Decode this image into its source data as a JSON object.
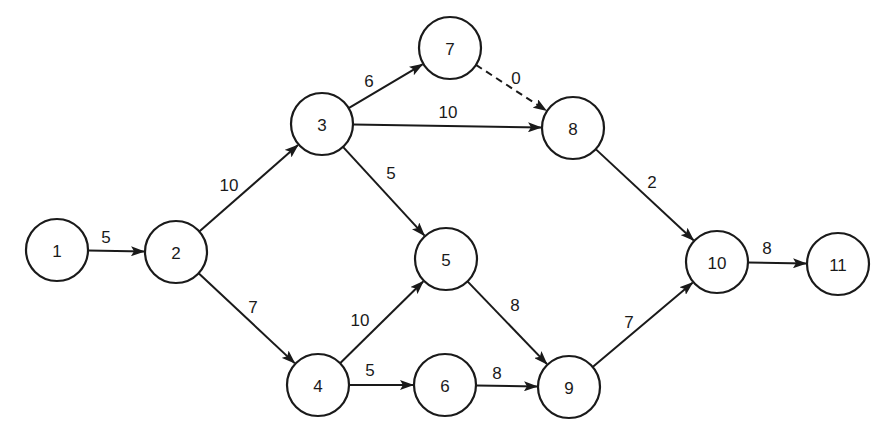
{
  "diagram": {
    "type": "activity-on-arrow network",
    "nodes": [
      {
        "id": "1",
        "label": "1",
        "x": 57,
        "y": 250
      },
      {
        "id": "2",
        "label": "2",
        "x": 176,
        "y": 252
      },
      {
        "id": "3",
        "label": "3",
        "x": 322,
        "y": 124
      },
      {
        "id": "4",
        "label": "4",
        "x": 318,
        "y": 385
      },
      {
        "id": "5",
        "label": "5",
        "x": 446,
        "y": 259
      },
      {
        "id": "6",
        "label": "6",
        "x": 445,
        "y": 385
      },
      {
        "id": "7",
        "label": "7",
        "x": 450,
        "y": 48
      },
      {
        "id": "8",
        "label": "8",
        "x": 573,
        "y": 128
      },
      {
        "id": "9",
        "label": "9",
        "x": 569,
        "y": 387
      },
      {
        "id": "10",
        "label": "10",
        "x": 717,
        "y": 262
      },
      {
        "id": "11",
        "label": "11",
        "x": 838,
        "y": 264
      }
    ],
    "edges": [
      {
        "from": "1",
        "to": "2",
        "label": "5",
        "dashed": false,
        "lx": 106,
        "ly": 237
      },
      {
        "from": "2",
        "to": "3",
        "label": "10",
        "dashed": false,
        "lx": 229,
        "ly": 185
      },
      {
        "from": "2",
        "to": "4",
        "label": "7",
        "dashed": false,
        "lx": 253,
        "ly": 307
      },
      {
        "from": "3",
        "to": "7",
        "label": "6",
        "dashed": false,
        "lx": 369,
        "ly": 81
      },
      {
        "from": "3",
        "to": "8",
        "label": "10",
        "dashed": false,
        "lx": 448,
        "ly": 112
      },
      {
        "from": "3",
        "to": "5",
        "label": "5",
        "dashed": false,
        "lx": 391,
        "ly": 173
      },
      {
        "from": "7",
        "to": "8",
        "label": "0",
        "dashed": true,
        "lx": 516,
        "ly": 78
      },
      {
        "from": "8",
        "to": "10",
        "label": "2",
        "dashed": false,
        "lx": 652,
        "ly": 182
      },
      {
        "from": "4",
        "to": "5",
        "label": "10",
        "dashed": false,
        "lx": 360,
        "ly": 320
      },
      {
        "from": "4",
        "to": "6",
        "label": "5",
        "dashed": false,
        "lx": 370,
        "ly": 370
      },
      {
        "from": "5",
        "to": "9",
        "label": "8",
        "dashed": false,
        "lx": 515,
        "ly": 305
      },
      {
        "from": "6",
        "to": "9",
        "label": "8",
        "dashed": false,
        "lx": 497,
        "ly": 373
      },
      {
        "from": "9",
        "to": "10",
        "label": "7",
        "dashed": false,
        "lx": 629,
        "ly": 322
      },
      {
        "from": "10",
        "to": "11",
        "label": "8",
        "dashed": false,
        "lx": 767,
        "ly": 248
      }
    ],
    "node_radius": 31,
    "colors": {
      "stroke": "#1a1a1a",
      "background": "#ffffff"
    }
  }
}
